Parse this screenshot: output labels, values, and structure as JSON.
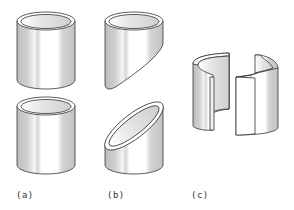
{
  "figure": {
    "panels": [
      {
        "id": "a",
        "label": "(a)",
        "caption_x": 16,
        "desc": "tube cut straight across into two cylinders"
      },
      {
        "id": "b",
        "label": "(b)",
        "caption_x": 107,
        "desc": "tube cut obliquely producing elliptical section"
      },
      {
        "id": "c",
        "label": "(c)",
        "caption_x": 191,
        "desc": "tube split lengthwise into two halves"
      }
    ],
    "colors": {
      "stroke": "#333333",
      "shade": "#c8c8c8",
      "light": "#ffffff",
      "inner": "#d9d9d9"
    }
  }
}
